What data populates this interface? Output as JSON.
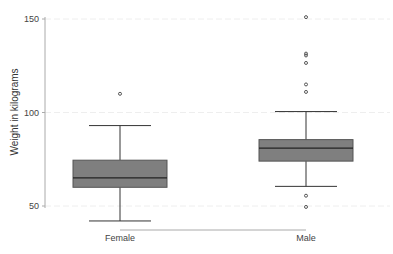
{
  "chart_data": {
    "type": "box",
    "title": "",
    "xlabel": "",
    "ylabel": "Weight in kilograms",
    "ylim": [
      45,
      152
    ],
    "yticks": [
      50,
      100,
      150
    ],
    "grid": true,
    "categories": [
      "Female",
      "Male"
    ],
    "series": [
      {
        "name": "Female",
        "whisker_low": 42,
        "q1": 60,
        "median": 65,
        "q3": 74.5,
        "whisker_high": 93,
        "outliers": [
          110
        ]
      },
      {
        "name": "Male",
        "whisker_low": 60.5,
        "q1": 74,
        "median": 81,
        "q3": 85.5,
        "whisker_high": 100.5,
        "outliers": [
          49.5,
          55.5,
          111,
          115,
          126.5,
          130.5,
          131.5,
          151
        ]
      }
    ],
    "box_color": "#7f7f7f",
    "line_color": "#333333"
  }
}
